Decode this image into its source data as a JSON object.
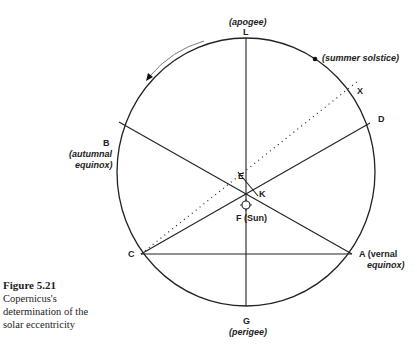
{
  "caption": {
    "title": "Figure 5.21",
    "lines": [
      "Copernicus's",
      "determination of the",
      "solar eccentricity"
    ]
  },
  "labels": {
    "L": "L",
    "apogee": "(apogee)",
    "G": "G",
    "perigee": "(perigee)",
    "summer_solstice": "(summer solstice)",
    "X": "X",
    "B": "B",
    "autumnal": "(autumnal",
    "equinox_b": "equinox)",
    "D": "D",
    "E": "E",
    "K": "K",
    "F_sun": "F (Sun)",
    "C": "C",
    "A_vernal": "A (vernal",
    "equinox_a": "equinox)"
  },
  "colors": {
    "line": "#222222",
    "background": "#ffffff"
  },
  "geometry": {
    "circle_center": [
      246,
      172
    ],
    "rx": 129,
    "ry": 134,
    "points": {
      "L": [
        246,
        38
      ],
      "G": [
        246,
        307
      ],
      "B": [
        119,
        122
      ],
      "D": [
        370,
        123
      ],
      "C": [
        141,
        254
      ],
      "A": [
        352,
        254
      ],
      "X": [
        361,
        79
      ],
      "F": [
        246,
        205
      ],
      "E": [
        238,
        172
      ],
      "K": [
        259,
        197
      ],
      "summer_solstice": [
        315,
        59
      ]
    }
  }
}
